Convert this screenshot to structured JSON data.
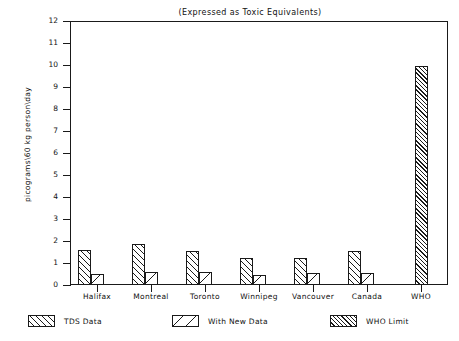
{
  "chart_data": {
    "type": "bar",
    "title": "(Expressed as Toxic Equivalents)",
    "xlabel": "",
    "ylabel": "picograms\\60 kg person\\day",
    "ylim": [
      0,
      12
    ],
    "ytick_step": 1,
    "yticks": [
      "12",
      "11",
      "10",
      "9",
      "8",
      "7",
      "6",
      "5",
      "4",
      "3",
      "2",
      "1",
      "0"
    ],
    "grid": false,
    "legend_position": "bottom",
    "categories": [
      "Halifax",
      "Montreal",
      "Toronto",
      "Winnipeg",
      "Vancouver",
      "Canada",
      "WHO"
    ],
    "series": [
      {
        "name": "TDS Data",
        "pattern": "diagonal-hatch-medium",
        "values": [
          1.6,
          1.85,
          1.55,
          1.25,
          1.25,
          1.55,
          null
        ]
      },
      {
        "name": "With New Data",
        "pattern": "diagonal-hatch-sparse",
        "values": [
          0.5,
          0.6,
          0.6,
          0.45,
          0.55,
          0.55,
          null
        ]
      },
      {
        "name": "WHO Limit",
        "pattern": "diagonal-hatch-dense",
        "values": [
          null,
          null,
          null,
          null,
          null,
          null,
          9.95
        ]
      }
    ]
  },
  "legend": {
    "items": [
      {
        "label": "TDS Data",
        "swatch": "hatch-tds"
      },
      {
        "label": "With New Data",
        "swatch": "hatch-new"
      },
      {
        "label": "WHO Limit",
        "swatch": "hatch-who"
      }
    ]
  },
  "colors": {
    "ink": "#1a1a1a",
    "background": "#ffffff"
  }
}
